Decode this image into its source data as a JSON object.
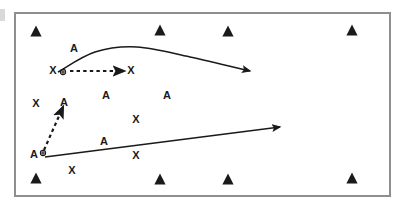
{
  "diagram": {
    "frame": {
      "border_color": "#8e8e90",
      "fill_color": "#ffffff",
      "x": 14,
      "y": 12,
      "width": 377,
      "height": 185
    },
    "ink_color": "#1a1a1a",
    "edge_mark_color": "#b9b9b9"
  },
  "chart_data": {
    "type": "scatter",
    "xlabel": "",
    "ylabel": "",
    "xlim": [
      0,
      406
    ],
    "ylim": [
      0,
      212
    ],
    "grid": false,
    "legend": null,
    "defenders": [
      {
        "label": "triangle",
        "x": 36,
        "y": 31
      },
      {
        "label": "triangle",
        "x": 160,
        "y": 30
      },
      {
        "label": "triangle",
        "x": 228,
        "y": 31
      },
      {
        "label": "triangle",
        "x": 352,
        "y": 30
      },
      {
        "label": "triangle",
        "x": 36,
        "y": 178
      },
      {
        "label": "triangle",
        "x": 160,
        "y": 179
      },
      {
        "label": "triangle",
        "x": 228,
        "y": 179
      },
      {
        "label": "triangle",
        "x": 352,
        "y": 178
      }
    ],
    "players": [
      {
        "label": "A",
        "x": 74,
        "y": 48
      },
      {
        "label": "X",
        "x": 53,
        "y": 70
      },
      {
        "label": "X",
        "x": 131,
        "y": 70
      },
      {
        "label": "A",
        "x": 106,
        "y": 95
      },
      {
        "label": "A",
        "x": 167,
        "y": 95
      },
      {
        "label": "X",
        "x": 36,
        "y": 103
      },
      {
        "label": "A",
        "x": 64,
        "y": 102
      },
      {
        "label": "X",
        "x": 136,
        "y": 119
      },
      {
        "label": "A",
        "x": 104,
        "y": 141
      },
      {
        "label": "A",
        "x": 34,
        "y": 154
      },
      {
        "label": "X",
        "x": 136,
        "y": 155
      },
      {
        "label": "X",
        "x": 72,
        "y": 170
      }
    ],
    "ball_markers": [
      {
        "attached_to": "X",
        "x": 63,
        "y": 72
      },
      {
        "attached_to": "A",
        "x": 43,
        "y": 153
      }
    ],
    "routes": [
      {
        "name": "curved-route-top",
        "style": "solid",
        "arrowhead": true,
        "points": [
          [
            58,
            72
          ],
          [
            95,
            52
          ],
          [
            137,
            47
          ],
          [
            190,
            57
          ],
          [
            250,
            71
          ]
        ]
      },
      {
        "name": "dashed-pass-horizontal",
        "style": "dashed",
        "arrowhead": true,
        "points": [
          [
            70,
            71
          ],
          [
            124,
            71
          ]
        ]
      },
      {
        "name": "dashed-pass-diagonal",
        "style": "dashed",
        "arrowhead": true,
        "points": [
          [
            44,
            150
          ],
          [
            63,
            107
          ]
        ]
      },
      {
        "name": "straight-route-bottom",
        "style": "solid",
        "arrowhead": true,
        "points": [
          [
            45,
            157
          ],
          [
            280,
            127
          ]
        ]
      }
    ]
  }
}
